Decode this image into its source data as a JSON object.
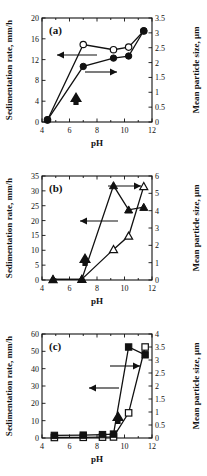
{
  "figure": {
    "panel_count": 3,
    "shared_xlabel": "pH",
    "left_axis_title": "Sedimentation rate, mm/h",
    "right_axis_title": "Mean particle size, µm"
  },
  "chart_data": [
    {
      "type": "line",
      "panel": "a",
      "title": "(a)",
      "xlabel": "pH",
      "ylabel": "Sedimentation rate, mm/h",
      "y2label": "Mean particle size, µm",
      "xlim": [
        4,
        12
      ],
      "ylim": [
        0,
        20
      ],
      "y2lim": [
        0,
        3.5
      ],
      "xticks": [
        4,
        6,
        8,
        10,
        12
      ],
      "yticks": [
        0,
        4,
        8,
        12,
        16,
        20
      ],
      "y2ticks": [
        0,
        0.5,
        1,
        1.5,
        2,
        2.5,
        3,
        3.5
      ],
      "grid": false,
      "legend": "none",
      "annotations": [
        {
          "text": "left-pointing arrow to sedimentation rate axis",
          "symbol": "←"
        },
        {
          "text": "right-pointing arrow to mean particle size axis",
          "symbol": "→"
        },
        {
          "text": "bold up arrow marker",
          "symbol": "↑"
        }
      ],
      "series": [
        {
          "name": "Sedimentation rate",
          "axis": "left",
          "marker": "open-circle",
          "x": [
            4.4,
            7.0,
            9.2,
            10.3,
            11.4
          ],
          "values": [
            0.4,
            14.9,
            13.9,
            14.4,
            17.5
          ]
        },
        {
          "name": "Mean particle size",
          "axis": "right",
          "marker": "filled-circle",
          "x": [
            4.4,
            7.0,
            9.2,
            10.3,
            11.4
          ],
          "values": [
            0.07,
            1.87,
            2.15,
            2.22,
            3.07
          ]
        }
      ]
    },
    {
      "type": "line",
      "panel": "b",
      "title": "(b)",
      "xlabel": "pH",
      "ylabel": "Sedimentation rate, mm/h",
      "y2label": "Mean particle size, µm",
      "xlim": [
        4,
        12
      ],
      "ylim": [
        0,
        35
      ],
      "y2lim": [
        0,
        6
      ],
      "xticks": [
        4,
        6,
        8,
        10,
        12
      ],
      "yticks": [
        0,
        5,
        10,
        15,
        20,
        25,
        30,
        35
      ],
      "y2ticks": [
        0,
        1,
        2,
        3,
        4,
        5,
        6
      ],
      "grid": false,
      "legend": "none",
      "annotations": [
        {
          "text": "left-pointing arrow to sedimentation rate axis",
          "symbol": "←"
        },
        {
          "text": "right-pointing arrow to mean particle size axis",
          "symbol": "→"
        },
        {
          "text": "bold up arrow marker",
          "symbol": "↑"
        }
      ],
      "series": [
        {
          "name": "Sedimentation rate",
          "axis": "left",
          "marker": "open-triangle",
          "x": [
            4.8,
            6.9,
            9.2,
            10.3,
            11.4
          ],
          "values": [
            0.2,
            0.3,
            10.3,
            14.8,
            31.5
          ]
        },
        {
          "name": "Mean particle size",
          "axis": "right",
          "marker": "filled-triangle",
          "x": [
            4.8,
            6.9,
            9.2,
            10.3,
            11.4
          ],
          "values": [
            0.04,
            0.05,
            5.45,
            4.05,
            4.2
          ]
        }
      ]
    },
    {
      "type": "line",
      "panel": "c",
      "title": "(c)",
      "xlabel": "pH",
      "ylabel": "Sedimentation rate, mm/h",
      "y2label": "Mean particle size, µm",
      "xlim": [
        4,
        12
      ],
      "ylim": [
        0,
        60
      ],
      "y2lim": [
        0,
        4
      ],
      "xticks": [
        4,
        6,
        8,
        10,
        12
      ],
      "yticks": [
        0,
        10,
        20,
        30,
        40,
        50,
        60
      ],
      "y2ticks": [
        0,
        0.5,
        1,
        1.5,
        2,
        2.5,
        3,
        3.5,
        4
      ],
      "grid": false,
      "legend": "none",
      "annotations": [
        {
          "text": "left-pointing arrow to sedimentation rate axis",
          "symbol": "←"
        },
        {
          "text": "right-pointing arrow to mean particle size axis",
          "symbol": "→"
        },
        {
          "text": "bold up arrow marker",
          "symbol": "↑"
        }
      ],
      "series": [
        {
          "name": "Sedimentation rate",
          "axis": "left",
          "marker": "open-square",
          "x": [
            4.9,
            7.0,
            8.4,
            9.2,
            10.3,
            11.5
          ],
          "values": [
            0.3,
            0.4,
            0.5,
            0.6,
            14.5,
            52.5
          ]
        },
        {
          "name": "Mean particle size",
          "axis": "right",
          "marker": "filled-square",
          "x": [
            4.9,
            7.0,
            8.4,
            9.2,
            10.3,
            11.5
          ],
          "values": [
            0.1,
            0.11,
            0.13,
            0.15,
            3.5,
            3.2
          ]
        }
      ]
    }
  ],
  "panels": {
    "a": {
      "label": "(a)",
      "xlabel": "pH",
      "ylabel": "Sedimentation rate, mm/h",
      "y2label": "Mean particle size, µm",
      "xticks": [
        "4",
        "6",
        "8",
        "10",
        "12"
      ],
      "yticks": [
        "0",
        "4",
        "8",
        "12",
        "16",
        "20"
      ],
      "y2ticks": [
        "0",
        "0.5",
        "1",
        "1.5",
        "2",
        "2.5",
        "3",
        "3.5"
      ]
    },
    "b": {
      "label": "(b)",
      "xlabel": "pH",
      "ylabel": "Sedimentation rate, mm/h",
      "y2label": "Mean particle size, µm",
      "xticks": [
        "4",
        "6",
        "8",
        "10",
        "12"
      ],
      "yticks": [
        "0",
        "5",
        "10",
        "15",
        "20",
        "25",
        "30",
        "35"
      ],
      "y2ticks": [
        "0",
        "1",
        "2",
        "3",
        "4",
        "5",
        "6"
      ]
    },
    "c": {
      "label": "(c)",
      "xlabel": "pH",
      "ylabel": "Sedimentation rate, mm/h",
      "y2label": "Mean particle size, µm",
      "xticks": [
        "4",
        "6",
        "8",
        "10",
        "12"
      ],
      "yticks": [
        "0",
        "10",
        "20",
        "30",
        "40",
        "50",
        "60"
      ],
      "y2ticks": [
        "0",
        "0.5",
        "1",
        "1.5",
        "2",
        "2.5",
        "3",
        "3.5",
        "4"
      ]
    }
  }
}
